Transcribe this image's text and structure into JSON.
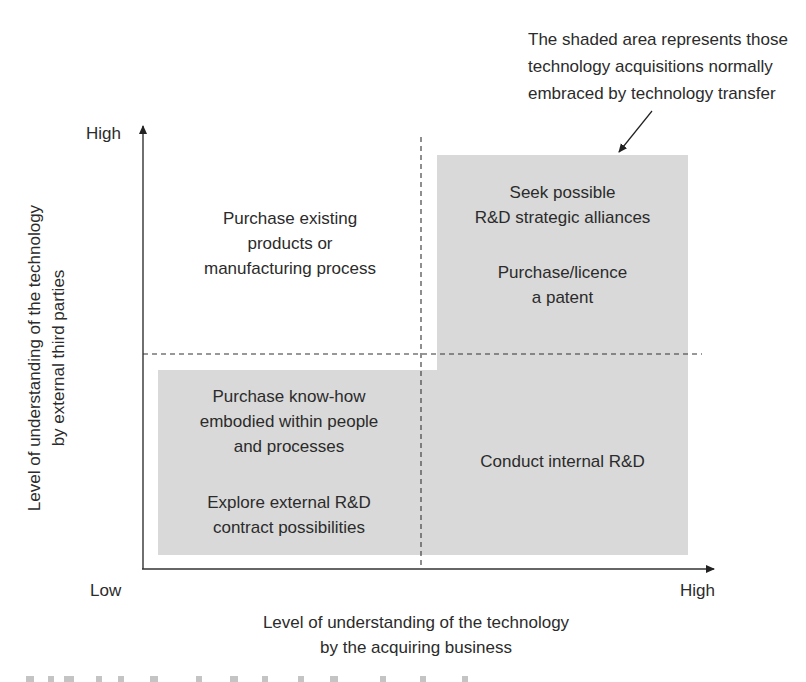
{
  "diagram": {
    "type": "2x2 matrix",
    "annotation": {
      "lines": [
        "The shaded area represents those",
        "technology acquisitions normally",
        "embraced by technology transfer"
      ]
    },
    "y_axis": {
      "high_label": "High",
      "low_label": "Low",
      "title_lines": [
        "Level of understanding of the technology",
        "by external third parties"
      ]
    },
    "x_axis": {
      "low_label": "Low",
      "high_label": "High",
      "title_lines": [
        "Level of understanding of the technology",
        "by the acquiring business"
      ]
    },
    "quadrants": {
      "top_left": {
        "shaded": false,
        "lines": [
          "Purchase existing",
          "products or",
          "manufacturing process"
        ]
      },
      "top_right": {
        "shaded": true,
        "blocks": [
          {
            "lines": [
              "Seek possible",
              "R&D strategic alliances"
            ]
          },
          {
            "lines": [
              "Purchase/licence",
              "a patent"
            ]
          }
        ]
      },
      "bottom_left": {
        "shaded": true,
        "blocks": [
          {
            "lines": [
              "Purchase know-how",
              "embodied within people",
              "and processes"
            ]
          },
          {
            "lines": [
              "Explore external R&D",
              "contract possibilities"
            ]
          }
        ]
      },
      "bottom_right": {
        "shaded": true,
        "lines": [
          "Conduct internal R&D"
        ]
      }
    },
    "colors": {
      "shade": "#d9d9d9",
      "text": "#2b2b2b",
      "axis": "#333333"
    }
  }
}
